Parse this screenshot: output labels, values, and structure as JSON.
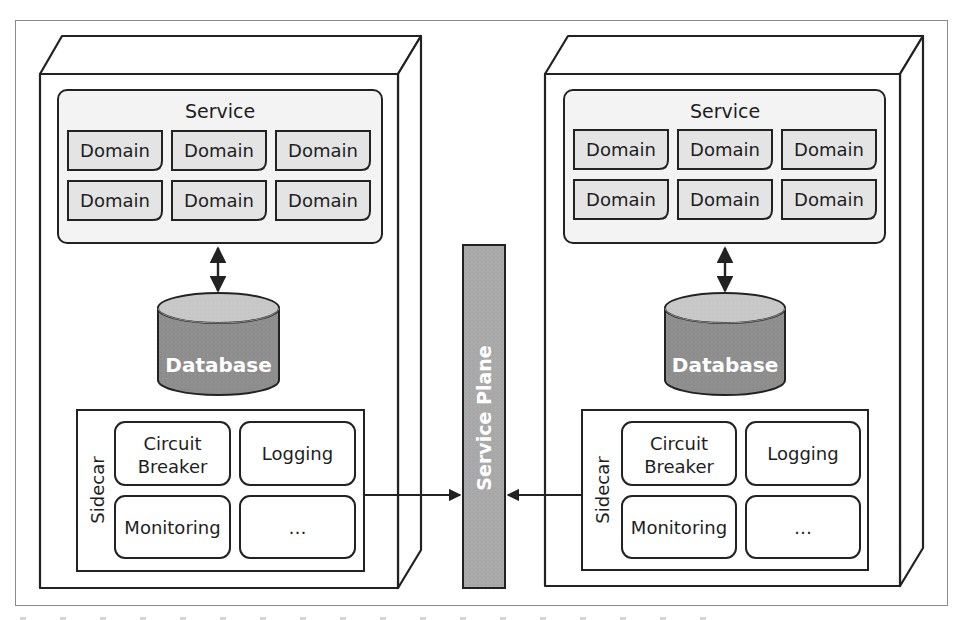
{
  "diagram": {
    "type": "sidecar-service-mesh",
    "colors": {
      "stroke": "#222222",
      "frame": "#8a8a8a",
      "service_fill": "#f3f3f3",
      "domain_fill": "#e4e4e4",
      "db_top": "#c8c8c8",
      "db_body": "#8e8e8e",
      "plane_fill": "#a9a9a9",
      "label_white": "#ffffff"
    },
    "nodes": [
      {
        "service": {
          "title": "Service",
          "domains": [
            "Domain",
            "Domain",
            "Domain",
            "Domain",
            "Domain",
            "Domain"
          ]
        },
        "database": {
          "label": "Database"
        },
        "sidecar": {
          "label": "Sidecar",
          "cells": [
            {
              "line1": "Circuit",
              "line2": "Breaker"
            },
            {
              "line1": "Logging",
              "line2": ""
            },
            {
              "line1": "Monitoring",
              "line2": ""
            },
            {
              "line1": "…",
              "line2": ""
            }
          ]
        }
      },
      {
        "service": {
          "title": "Service",
          "domains": [
            "Domain",
            "Domain",
            "Domain",
            "Domain",
            "Domain",
            "Domain"
          ]
        },
        "database": {
          "label": "Database"
        },
        "sidecar": {
          "label": "Sidecar",
          "cells": [
            {
              "line1": "Circuit",
              "line2": "Breaker"
            },
            {
              "line1": "Logging",
              "line2": ""
            },
            {
              "line1": "Monitoring",
              "line2": ""
            },
            {
              "line1": "…",
              "line2": ""
            }
          ]
        }
      }
    ],
    "service_plane": {
      "label": "Service Plane"
    },
    "edges": [
      {
        "from": "service-left",
        "to": "database-left",
        "type": "bidirectional"
      },
      {
        "from": "service-right",
        "to": "database-right",
        "type": "bidirectional"
      },
      {
        "from": "sidecar-left",
        "to": "service-plane",
        "type": "directed"
      },
      {
        "from": "sidecar-right",
        "to": "service-plane",
        "type": "directed"
      }
    ]
  }
}
